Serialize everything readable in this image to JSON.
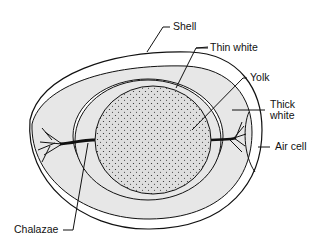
{
  "diagram": {
    "labels": {
      "shell": "Shell",
      "thin_white": "Thin white",
      "yolk": "Yolk",
      "thick_white_line1": "Thick",
      "thick_white_line2": "white",
      "air_cell": "Air cell",
      "chalazae": "Chalazae"
    },
    "colors": {
      "outline": "#111111",
      "thick_white_fill": "#e6e6e6",
      "thin_white_fill": "#ffffff",
      "yolk_fill": "#dcdcdc"
    }
  }
}
